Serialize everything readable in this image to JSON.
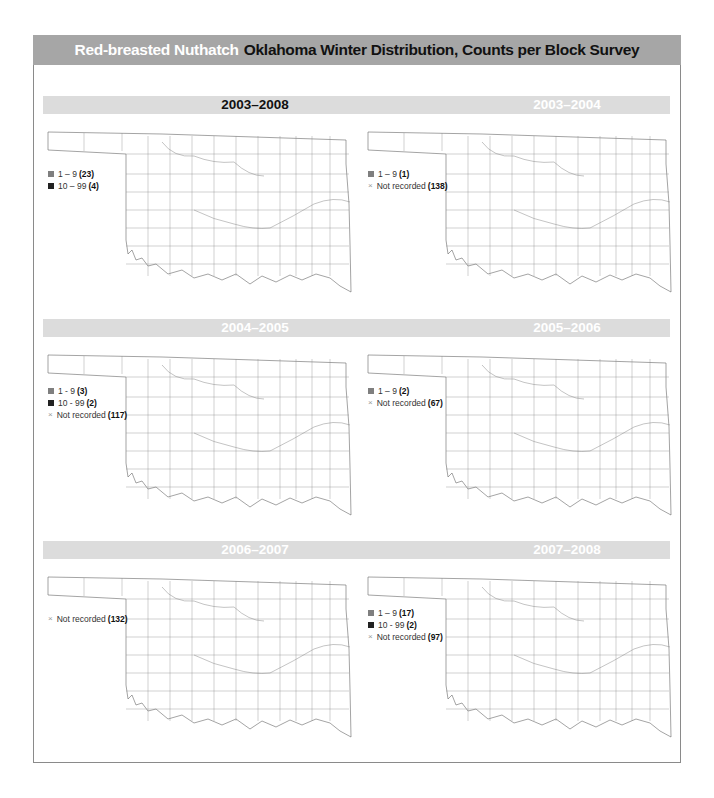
{
  "title": {
    "species": "Red-breasted Nuthatch",
    "subtitle": "Oklahoma Winter Distribution, Counts per Block Survey"
  },
  "colors": {
    "title_bar": "#a6a6a6",
    "band": "#dcdcdc",
    "count_1_9": "#7f7f7f",
    "count_10_99": "#222222",
    "not_recorded": "#999999"
  },
  "panels": [
    {
      "label": "2003–2008",
      "legend": [
        {
          "type": "light",
          "range": "1 – 9",
          "count": "(23)"
        },
        {
          "type": "dark",
          "range": "10 – 99",
          "count": "(4)"
        }
      ]
    },
    {
      "label": "2003–2004",
      "legend": [
        {
          "type": "light",
          "range": "1 – 9",
          "count": "(1)"
        },
        {
          "type": "x",
          "range": "Not recorded",
          "count": "(138)"
        }
      ]
    },
    {
      "label": "2004–2005",
      "legend": [
        {
          "type": "light",
          "range": "1 - 9",
          "count": "(3)"
        },
        {
          "type": "dark",
          "range": "10 - 99",
          "count": "(2)"
        },
        {
          "type": "x",
          "range": "Not recorded",
          "count": "(117)"
        }
      ]
    },
    {
      "label": "2005–2006",
      "legend": [
        {
          "type": "light",
          "range": "1 – 9",
          "count": "(2)"
        },
        {
          "type": "x",
          "range": "Not recorded",
          "count": "(67)"
        }
      ]
    },
    {
      "label": "2006–2007",
      "legend": [
        {
          "type": "x",
          "range": "Not recorded",
          "count": "(132)"
        }
      ]
    },
    {
      "label": "2007–2008",
      "legend": [
        {
          "type": "light",
          "range": "1 – 9",
          "count": "(17)"
        },
        {
          "type": "dark",
          "range": "10 - 99",
          "count": "(2)"
        },
        {
          "type": "x",
          "range": "Not recorded",
          "count": "(97)"
        }
      ]
    }
  ],
  "legend_symbols": {
    "x": "×"
  }
}
